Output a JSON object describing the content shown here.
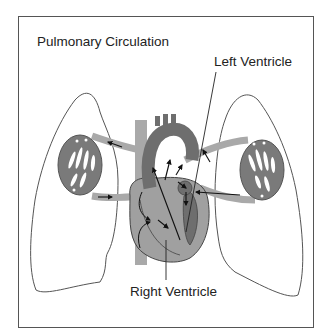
{
  "diagram": {
    "title": "Pulmonary Circulation",
    "labels": {
      "left_ventricle": "Left Ventricle",
      "right_ventricle": "Right Ventricle"
    },
    "colors": {
      "vessel_light": "#a9a9a9",
      "heart_dark": "#6e6e6e",
      "heart_mid": "#9a9a9a",
      "outline": "#444444",
      "frame": "#555555"
    },
    "components": [
      "left lung",
      "right lung",
      "heart",
      "aorta",
      "pulmonary artery",
      "pulmonary veins",
      "vena cava",
      "lung capillary beds"
    ]
  }
}
